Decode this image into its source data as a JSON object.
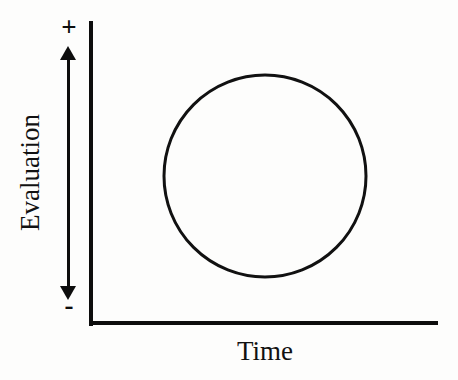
{
  "figure": {
    "background_color": "#fdfdfc",
    "ink_color": "#0d0d0d"
  },
  "axes": {
    "y_axis": {
      "title": "Evaluation",
      "positive_marker": "+",
      "negative_marker": "-",
      "direction_indicator": "double-headed-vertical-arrow"
    },
    "x_axis": {
      "title": "Time"
    }
  },
  "chart_data": {
    "type": "line",
    "title": "",
    "subtitle": "",
    "xlabel": "Time",
    "ylabel": "Evaluation",
    "xlim": [
      0,
      1
    ],
    "ylim": [
      0,
      1
    ],
    "grid": false,
    "legend": false,
    "axis_tick_labels": {
      "y": [
        "+",
        "-"
      ],
      "x": []
    },
    "annotations": [],
    "series": [
      {
        "name": "evaluation-trajectory",
        "shape": "closed-circle",
        "stroke_color": "#111111",
        "stroke_width": 3,
        "fill": "none",
        "center_x": 265,
        "center_y": 176,
        "radius": 101,
        "x": [
          265,
          336,
          366,
          336,
          265,
          194,
          164,
          194,
          265
        ],
        "y": [
          75,
          105,
          176,
          247,
          277,
          247,
          176,
          105,
          75
        ]
      }
    ]
  }
}
